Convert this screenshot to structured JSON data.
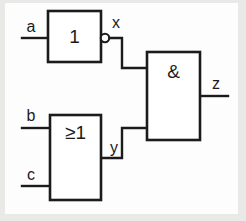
{
  "diagram": {
    "notation": "IEC 60617 rectangular gate symbols",
    "line_color": "#1b1b1b",
    "background_color": "#fdfdfd",
    "frame_color": "#e9e9e7"
  },
  "gates": {
    "not_gate": {
      "symbol": "1",
      "type": "NOT",
      "inverted_output": true
    },
    "or_gate": {
      "symbol": "≥1",
      "type": "OR",
      "inverted_output": false
    },
    "and_gate": {
      "symbol": "&",
      "type": "AND",
      "inverted_output": false
    }
  },
  "signals": {
    "input_a": "a",
    "input_b": "b",
    "input_c": "c",
    "internal_x": "x",
    "internal_y": "y",
    "output_z": "z"
  }
}
